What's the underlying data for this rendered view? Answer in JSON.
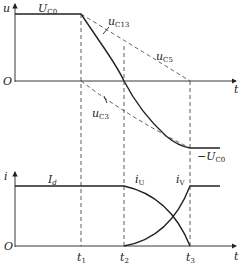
{
  "diagram": {
    "top_plot": {
      "y_axis_label": "u",
      "x_axis_label": "t",
      "origin_label": "O",
      "curves": [
        {
          "name": "U",
          "subscript": "C0",
          "desc": "initial capacitor voltage level"
        },
        {
          "name": "u",
          "subscript": "C13",
          "desc": "solid falling curve"
        },
        {
          "name": "u",
          "subscript": "C5",
          "desc": "dashed upper curve"
        },
        {
          "name": "u",
          "subscript": "C3",
          "desc": "dashed lower curve"
        }
      ],
      "final_level": {
        "prefix": "−U",
        "subscript": "C0"
      }
    },
    "bottom_plot": {
      "y_axis_label": "i",
      "x_axis_label": "t",
      "origin_label": "O",
      "curves": [
        {
          "name": "I",
          "subscript": "d"
        },
        {
          "name": "i",
          "subscript": "U"
        },
        {
          "name": "i",
          "subscript": "V"
        }
      ]
    },
    "time_markers": [
      {
        "name": "t",
        "subscript": "1"
      },
      {
        "name": "t",
        "subscript": "2"
      },
      {
        "name": "t",
        "subscript": "3"
      }
    ]
  }
}
